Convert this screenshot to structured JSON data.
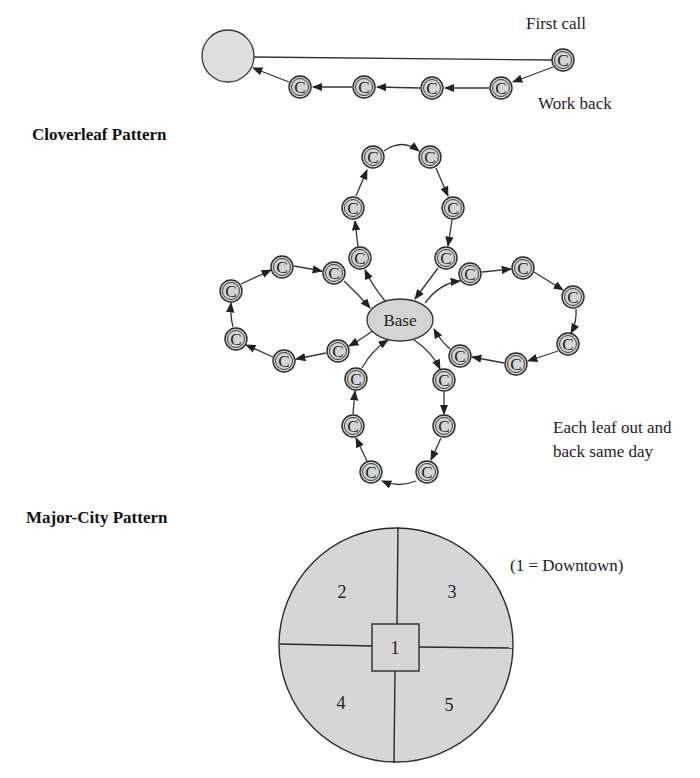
{
  "routing": {
    "labels": {
      "first_call": "First call",
      "work_back": "Work back"
    },
    "node_letter": "C",
    "nodes": [
      {
        "id": "c1",
        "x": 563,
        "y": 60
      },
      {
        "id": "c2",
        "x": 501,
        "y": 88
      },
      {
        "id": "c3",
        "x": 432,
        "y": 88
      },
      {
        "id": "c4",
        "x": 364,
        "y": 87
      },
      {
        "id": "c5",
        "x": 300,
        "y": 87
      }
    ],
    "base": {
      "x": 228,
      "y": 56,
      "r": 26
    }
  },
  "cloverleaf": {
    "title": "Cloverleaf Pattern",
    "base_label": "Base",
    "node_letter": "C",
    "caption_line1": "Each leaf out and",
    "caption_line2": "back same day",
    "leaves": {
      "top": [
        {
          "x": 360,
          "y": 258
        },
        {
          "x": 353,
          "y": 208
        },
        {
          "x": 373,
          "y": 157
        },
        {
          "x": 430,
          "y": 157
        },
        {
          "x": 453,
          "y": 208
        },
        {
          "x": 446,
          "y": 258
        }
      ],
      "left": [
        {
          "x": 338,
          "y": 351
        },
        {
          "x": 284,
          "y": 361
        },
        {
          "x": 236,
          "y": 339
        },
        {
          "x": 231,
          "y": 291
        },
        {
          "x": 282,
          "y": 267
        },
        {
          "x": 334,
          "y": 273
        }
      ],
      "right": [
        {
          "x": 470,
          "y": 274
        },
        {
          "x": 523,
          "y": 268
        },
        {
          "x": 573,
          "y": 297
        },
        {
          "x": 568,
          "y": 344
        },
        {
          "x": 516,
          "y": 364
        },
        {
          "x": 460,
          "y": 356
        }
      ],
      "bottom": [
        {
          "x": 444,
          "y": 380
        },
        {
          "x": 444,
          "y": 426
        },
        {
          "x": 427,
          "y": 472
        },
        {
          "x": 371,
          "y": 472
        },
        {
          "x": 353,
          "y": 426
        },
        {
          "x": 356,
          "y": 379
        }
      ]
    }
  },
  "major_city": {
    "title": "Major-City Pattern",
    "legend": "(1 = Downtown)",
    "zones": {
      "z1": "1",
      "z2": "2",
      "z3": "3",
      "z4": "4",
      "z5": "5"
    }
  },
  "colors": {
    "fill": "#d4d4d4",
    "stroke": "#2a2a2a",
    "background": "#ffffff"
  }
}
